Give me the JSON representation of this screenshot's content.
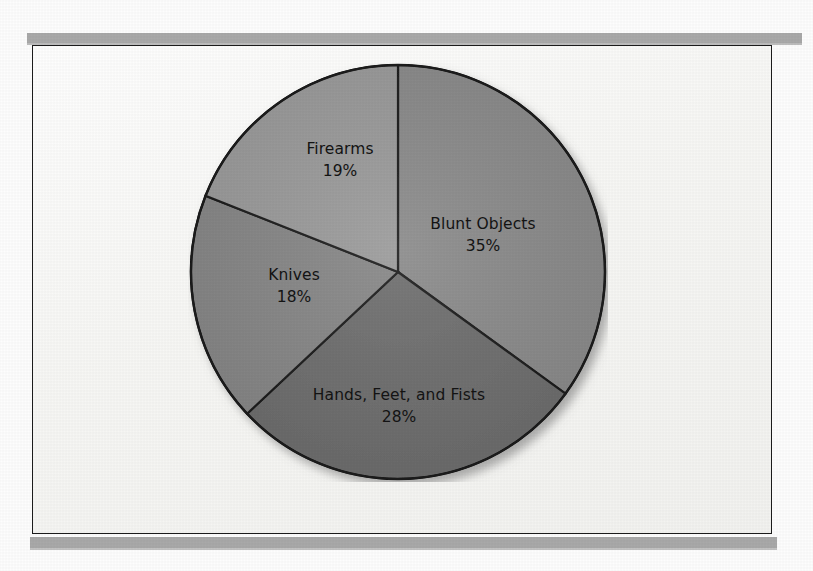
{
  "figure": {
    "caption": "",
    "frame_border_color": "#1c1c1c",
    "page_background": "#fdfdfd",
    "rule_color": "#a9a9a9"
  },
  "chart_data": {
    "type": "pie",
    "title": "",
    "subtitle": "",
    "xlabel": "",
    "ylabel": "",
    "legend_position": "none",
    "grid": false,
    "labels_inside_slices": true,
    "start_angle_deg": 0,
    "direction": "clockwise",
    "total_percent": 100,
    "categories": [
      "Blunt Objects",
      "Hands, Feet, and Fists",
      "Knives",
      "Firearms"
    ],
    "values": [
      35,
      28,
      18,
      19
    ],
    "value_suffix": "%",
    "slices": [
      {
        "label": "Blunt Objects",
        "value": 35,
        "value_text": "35%",
        "color": "#8b8b8b",
        "start_deg": 0,
        "end_deg": 126
      },
      {
        "label": "Hands, Feet, and Fists",
        "value": 28,
        "value_text": "28%",
        "color": "#6e6e6e",
        "start_deg": 126,
        "end_deg": 226.8
      },
      {
        "label": "Knives",
        "value": 18,
        "value_text": "18%",
        "color": "#878787",
        "start_deg": 226.8,
        "end_deg": 291.6
      },
      {
        "label": "Firearms",
        "value": 19,
        "value_text": "19%",
        "color": "#9b9b9b",
        "start_deg": 291.6,
        "end_deg": 360
      }
    ]
  }
}
